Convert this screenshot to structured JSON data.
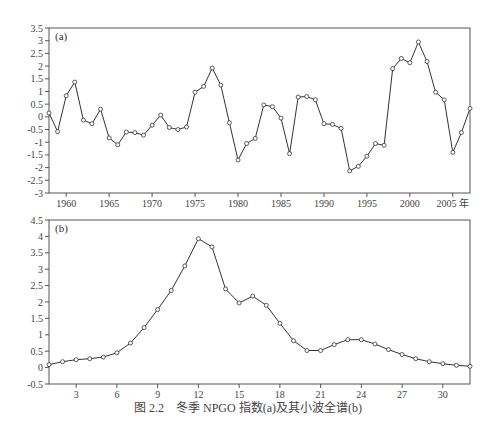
{
  "caption": "图 2.2　冬季 NPGO 指数(a)及其小波全谱(b)",
  "chart_data": [
    {
      "type": "line",
      "panel_label": "(a)",
      "title": "",
      "xlabel": "年",
      "ylabel": "",
      "x": [
        1958,
        1959,
        1960,
        1961,
        1962,
        1963,
        1964,
        1965,
        1966,
        1967,
        1968,
        1969,
        1970,
        1971,
        1972,
        1973,
        1974,
        1975,
        1976,
        1977,
        1978,
        1979,
        1980,
        1981,
        1982,
        1983,
        1984,
        1985,
        1986,
        1987,
        1988,
        1989,
        1990,
        1991,
        1992,
        1993,
        1994,
        1995,
        1996,
        1997,
        1998,
        1999,
        2000,
        2001,
        2002,
        2003,
        2004,
        2005,
        2006,
        2007
      ],
      "series": [
        {
          "name": "NPGO",
          "values": [
            0.15,
            -0.58,
            0.83,
            1.37,
            -0.13,
            -0.27,
            0.3,
            -0.83,
            -1.1,
            -0.6,
            -0.62,
            -0.72,
            -0.33,
            0.07,
            -0.42,
            -0.5,
            -0.4,
            0.97,
            1.2,
            1.92,
            1.25,
            -0.23,
            -1.7,
            -1.05,
            -0.85,
            0.47,
            0.4,
            -0.05,
            -1.45,
            0.78,
            0.8,
            0.67,
            -0.27,
            -0.3,
            -0.45,
            -2.13,
            -1.95,
            -1.55,
            -1.05,
            -1.12,
            1.9,
            2.3,
            2.13,
            2.95,
            2.18,
            0.97,
            0.67,
            -1.4,
            -0.62,
            0.33
          ]
        }
      ],
      "xticks": [
        1960,
        1965,
        1970,
        1975,
        1980,
        1985,
        1990,
        1995,
        2000,
        2005
      ],
      "xtick_labels": [
        "1960",
        "1965",
        "1970",
        "1975",
        "1980",
        "1985",
        "1990",
        "1995",
        "2000",
        "2005 年"
      ],
      "yticks": [
        3.5,
        3,
        2.5,
        2,
        1.5,
        1,
        0.5,
        0,
        -0.5,
        -1,
        -1.5,
        -2,
        -2.5,
        -3
      ],
      "ytick_labels": [
        "3.5",
        "3",
        "2.5",
        "2",
        "1.5",
        "1",
        "0.5",
        "0",
        "-0.5",
        "-1",
        "-1.5",
        "-2",
        "-2.5",
        "-3"
      ],
      "xlim": [
        1958,
        2007
      ],
      "ylim": [
        -3,
        3.5
      ],
      "grid": false,
      "legend": "none",
      "marker": "open-circle"
    },
    {
      "type": "line",
      "panel_label": "(b)",
      "title": "",
      "xlabel": "",
      "ylabel": "",
      "x": [
        1,
        2,
        3,
        4,
        5,
        6,
        7,
        8,
        9,
        10,
        11,
        12,
        13,
        14,
        15,
        16,
        17,
        18,
        19,
        20,
        21,
        22,
        23,
        24,
        25,
        26,
        27,
        28,
        29,
        30,
        31,
        32
      ],
      "series": [
        {
          "name": "wavelet global spectrum",
          "values": [
            0.09,
            0.18,
            0.24,
            0.27,
            0.32,
            0.45,
            0.75,
            1.22,
            1.77,
            2.35,
            3.1,
            3.93,
            3.68,
            2.4,
            1.97,
            2.18,
            1.9,
            1.35,
            0.82,
            0.52,
            0.52,
            0.7,
            0.85,
            0.85,
            0.72,
            0.55,
            0.4,
            0.27,
            0.18,
            0.12,
            0.07,
            0.04
          ]
        }
      ],
      "xticks": [
        3,
        6,
        9,
        12,
        15,
        18,
        21,
        24,
        27,
        30
      ],
      "xtick_labels": [
        "3",
        "6",
        "9",
        "12",
        "15",
        "18",
        "21",
        "24",
        "27",
        "30"
      ],
      "yticks": [
        4.5,
        4,
        3.5,
        3,
        2.5,
        2,
        1.5,
        1,
        0.5,
        0,
        -0.5
      ],
      "ytick_labels": [
        "4.5",
        "4",
        "3.5",
        "3",
        "2.5",
        "2",
        "1.5",
        "1",
        "0.5",
        "0",
        "-0.5"
      ],
      "xlim": [
        1,
        32
      ],
      "ylim": [
        -0.5,
        4.5
      ],
      "grid": false,
      "legend": "none",
      "marker": "open-circle"
    }
  ]
}
